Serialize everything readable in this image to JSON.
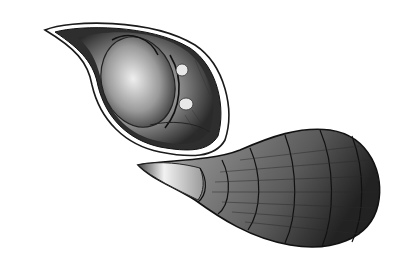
{
  "image": {
    "description": "Engraving-style illustration of a teardrop-shaped shell/seed shown in two views: an opened half revealing the interior, and an exterior view with banded segments",
    "style": "black-and-white stippled engraving",
    "colors": {
      "background": "#ffffff",
      "ink_dark": "#1a1a1a",
      "ink_mid": "#555555",
      "ink_light": "#bdbdbd"
    }
  }
}
